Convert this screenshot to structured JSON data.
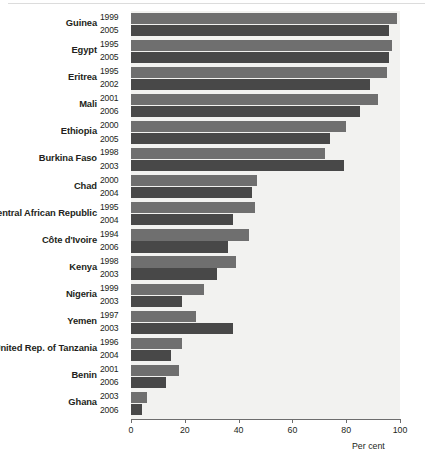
{
  "chart_data": {
    "type": "bar",
    "orientation": "horizontal",
    "title": "",
    "subtitle": "",
    "xlabel": "Per cent",
    "ylabel": "",
    "xlim": [
      0,
      100
    ],
    "xticks": [
      0,
      20,
      40,
      60,
      80,
      100
    ],
    "xtick_labels": [
      "0",
      "20",
      "40",
      "60",
      "80",
      "100"
    ],
    "grid": false,
    "legend": "none",
    "categories": [
      "Guinea",
      "Egypt",
      "Eritrea",
      "Mali",
      "Ethiopia",
      "Burkina Faso",
      "Chad",
      "Central African Republic",
      "Côte d'Ivoire",
      "Kenya",
      "Nigeria",
      "Yemen",
      "United Rep. of Tanzania",
      "Benin",
      "Ghana"
    ],
    "series": [
      {
        "name": "earlier survey",
        "color": "#6f6f6f",
        "years": [
          "1999",
          "1995",
          "1995",
          "2001",
          "2000",
          "1998",
          "2000",
          "1995",
          "1994",
          "1998",
          "1999",
          "1997",
          "1996",
          "2001",
          "2003"
        ],
        "values": [
          99,
          97,
          95,
          92,
          80,
          72,
          47,
          46,
          44,
          39,
          27,
          24,
          19,
          18,
          6
        ]
      },
      {
        "name": "later survey",
        "color": "#484848",
        "years": [
          "2005",
          "2005",
          "2002",
          "2006",
          "2005",
          "2003",
          "2004",
          "2004",
          "2006",
          "2003",
          "2003",
          "2003",
          "2004",
          "2006",
          "2006"
        ],
        "values": [
          96,
          96,
          89,
          85,
          74,
          79,
          45,
          38,
          36,
          32,
          19,
          38,
          15,
          13,
          4
        ]
      }
    ]
  },
  "axis": {
    "unit_label": "Per cent"
  },
  "colors": {
    "bar_earlier": "#6f6f6f",
    "bar_later": "#484848",
    "plot_background": "#f2f2f0",
    "axis": "#6d6d6d",
    "text": "#231f20"
  }
}
